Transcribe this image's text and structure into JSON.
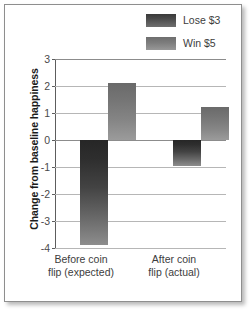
{
  "chart_data": {
    "type": "bar",
    "title": "",
    "subtitle": "",
    "xlabel": "",
    "ylabel": "Change from baseline happiness",
    "categories": [
      "Before coin flip (expected)",
      "After coin flip (actual)"
    ],
    "category_lines": [
      [
        "Before coin",
        "flip (expected)"
      ],
      [
        "After coin",
        "flip (actual)"
      ]
    ],
    "series": [
      {
        "name": "Lose $3",
        "values": [
          -3.9,
          -0.95
        ],
        "color": "#3a3a3a"
      },
      {
        "name": "Win $5",
        "values": [
          2.1,
          1.22
        ],
        "color": "#7d7d7d"
      }
    ],
    "ylim": [
      -4,
      3
    ],
    "yticks": [
      3,
      2,
      1,
      0,
      -1,
      -2,
      -3,
      -4
    ],
    "ytick_labels": [
      "3",
      "2",
      "1",
      "0",
      "-1",
      "-2",
      "-3",
      "-4"
    ],
    "grid": true,
    "grid_axis": "y",
    "legend_position": "top-right",
    "zero_line": 0
  },
  "legend": {
    "items": [
      {
        "label": "Lose $3",
        "swatch": "legend-swatch-lose"
      },
      {
        "label": "Win $5",
        "swatch": "legend-swatch-win"
      }
    ]
  },
  "axes": {
    "y_title": "Change from baseline happiness"
  }
}
